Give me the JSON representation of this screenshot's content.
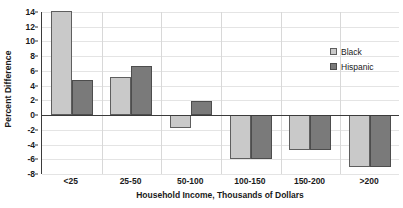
{
  "chart_data": {
    "type": "bar",
    "title": "",
    "xlabel": "Household Income, Thousands of Dollars",
    "ylabel": "Percent Difference",
    "categories": [
      "<25",
      "25-50",
      "50-100",
      "100-150",
      "150-200",
      ">200"
    ],
    "series": [
      {
        "name": "Black",
        "color": "#c9c9c9",
        "values": [
          14.1,
          5.2,
          -1.8,
          -6.0,
          -4.8,
          -7.0
        ]
      },
      {
        "name": "Hispanic",
        "color": "#7a7a7a",
        "values": [
          4.8,
          6.6,
          1.9,
          -6.0,
          -4.8,
          -7.0
        ]
      }
    ],
    "ylim": [
      -8,
      14
    ],
    "ytick_values": [
      14,
      12,
      10,
      8,
      6,
      4,
      2,
      0,
      -2,
      -4,
      -6,
      -8
    ],
    "ytick_labels": [
      "14",
      "12",
      "10",
      "8",
      "6",
      "4",
      "2",
      "0",
      "-2",
      "-4",
      "-6",
      "-8"
    ],
    "grid": true,
    "legend_position": "right"
  }
}
